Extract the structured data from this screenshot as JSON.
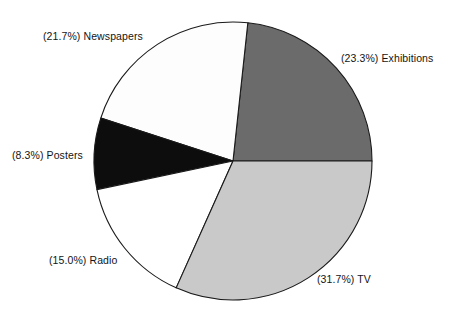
{
  "chart_data": {
    "type": "pie",
    "title": "",
    "xlabel": "",
    "ylabel": "",
    "legend_position": "none",
    "grid": false,
    "start_angle_deg": 0,
    "direction": "counterclockwise",
    "categories": [
      "Exhibitions",
      "Newspapers",
      "Posters",
      "Radio",
      "TV"
    ],
    "values": [
      23.3,
      21.7,
      8.3,
      15.0,
      31.7
    ],
    "unit": "%",
    "slices": [
      {
        "label": "Exhibitions",
        "value": 23.3,
        "percent_text": "(23.3%)",
        "annotation": "(23.3%) Exhibitions",
        "color": "#6b6b6b",
        "start_deg": 0,
        "end_deg": 83.88
      },
      {
        "label": "Newspapers",
        "value": 21.7,
        "percent_text": "(21.7%)",
        "annotation": "(21.7%) Newspapers",
        "color": "#fdfdfd",
        "start_deg": 83.88,
        "end_deg": 162.0
      },
      {
        "label": "Posters",
        "value": 8.3,
        "percent_text": "(8.3%)",
        "annotation": "(8.3%) Posters",
        "color": "#0d0d0d",
        "start_deg": 162.0,
        "end_deg": 191.88
      },
      {
        "label": "Radio",
        "value": 15.0,
        "percent_text": "(15.0%)",
        "annotation": "(15.0%) Radio",
        "color": "#ffffff",
        "start_deg": 191.88,
        "end_deg": 245.88
      },
      {
        "label": "TV",
        "value": 31.7,
        "percent_text": "(31.7%)",
        "annotation": "(31.7%) TV",
        "color": "#c9c9c9",
        "start_deg": 245.88,
        "end_deg": 360
      }
    ]
  },
  "labels": {
    "newspapers": "(21.7%) Newspapers",
    "exhibitions": "(23.3%) Exhibitions",
    "posters": "(8.3%) Posters",
    "radio": "(15.0%) Radio",
    "tv": "(31.7%) TV"
  },
  "colors": {
    "exhibitions": "#6b6b6b",
    "newspapers": "#fdfdfd",
    "posters": "#0d0d0d",
    "radio": "#ffffff",
    "tv": "#c9c9c9",
    "outline": "#1a1a1a",
    "background": "#ffffff",
    "text": "#141414"
  },
  "geometry": {
    "center_x": 233,
    "center_y": 161,
    "radius": 139
  }
}
